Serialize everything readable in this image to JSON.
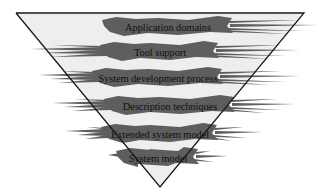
{
  "diagram": {
    "type": "inverted-pyramid-layers",
    "colors": {
      "background": "#ffffff",
      "triangle_fill": "#eeeeee",
      "triangle_stroke": "#1a1a1a",
      "band_fill": "#5e5e5e",
      "label_color": "#111111"
    },
    "triangle": {
      "top_left": [
        16,
        13
      ],
      "top_right": [
        304,
        13
      ],
      "apex": [
        160,
        187
      ]
    },
    "layers": [
      {
        "label": "Application domains",
        "cx": 168,
        "cy": 26,
        "half_width": 62,
        "spike_left": 150,
        "spike_right": 318
      },
      {
        "label": "Tool support",
        "cx": 160,
        "cy": 51,
        "half_width": 56,
        "spike_left": 30,
        "spike_right": 300
      },
      {
        "label": "System development process",
        "cx": 158,
        "cy": 77,
        "half_width": 62,
        "spike_left": 38,
        "spike_right": 300
      },
      {
        "label": "Description techniques",
        "cx": 170,
        "cy": 105,
        "half_width": 62,
        "spike_left": 52,
        "spike_right": 295
      },
      {
        "label": "Extended system model",
        "cx": 160,
        "cy": 133,
        "half_width": 55,
        "spike_left": 65,
        "spike_right": 262
      },
      {
        "label": "System model",
        "cx": 158,
        "cy": 157,
        "half_width": 38,
        "spike_left": 108,
        "spike_right": 228
      }
    ]
  }
}
